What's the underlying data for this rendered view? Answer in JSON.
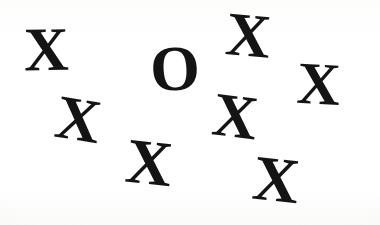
{
  "scene": {
    "kind": "letter-search-array",
    "background_color": "#ffffff",
    "ink_color": "#141414",
    "width": 380,
    "height": 225,
    "target_letter": "O",
    "distractor_letter": "X",
    "distractor_count": 7,
    "target_count": 1,
    "total_items": 8
  },
  "items": [
    {
      "id": "x-top-left",
      "label": "X",
      "role": "distractor",
      "x": 24,
      "y": 18,
      "size": 62,
      "rotation": -1
    },
    {
      "id": "o-target",
      "label": "O",
      "role": "target",
      "x": 150,
      "y": 37,
      "size": 64,
      "rotation": -3
    },
    {
      "id": "x-top-right",
      "label": "X",
      "role": "distractor",
      "x": 226,
      "y": 4,
      "size": 62,
      "rotation": 5
    },
    {
      "id": "x-far-right",
      "label": "X",
      "role": "distractor",
      "x": 297,
      "y": 54,
      "size": 60,
      "rotation": 3
    },
    {
      "id": "x-mid-left",
      "label": "X",
      "role": "distractor",
      "x": 56,
      "y": 88,
      "size": 62,
      "rotation": 9
    },
    {
      "id": "x-center",
      "label": "X",
      "role": "distractor",
      "x": 213,
      "y": 85,
      "size": 62,
      "rotation": 7
    },
    {
      "id": "x-bottom-center",
      "label": "X",
      "role": "distractor",
      "x": 126,
      "y": 131,
      "size": 64,
      "rotation": 6
    },
    {
      "id": "x-bottom-right",
      "label": "X",
      "role": "distractor",
      "x": 253,
      "y": 148,
      "size": 64,
      "rotation": 6
    }
  ]
}
